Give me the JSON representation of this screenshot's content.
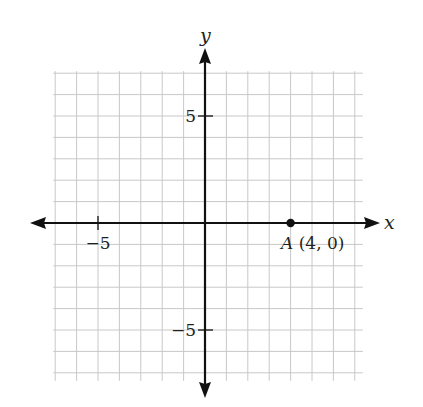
{
  "chart_data": {
    "type": "scatter",
    "title": "",
    "xlabel": "x",
    "ylabel": "y",
    "xlim": [
      -7,
      7
    ],
    "ylim": [
      -7,
      7
    ],
    "grid": true,
    "grid_step": 1,
    "x_ticks": [
      {
        "value": -5,
        "label": "−5"
      }
    ],
    "y_ticks": [
      {
        "value": 5,
        "label": "5"
      },
      {
        "value": -5,
        "label": "−5"
      }
    ],
    "points": [
      {
        "name": "A",
        "x": 4,
        "y": 0,
        "label": "A (4, 0)"
      }
    ],
    "colors": {
      "axis": "#111111",
      "grid": "#c8c8c8",
      "point": "#111111"
    }
  },
  "labels": {
    "x_axis": "x",
    "y_axis": "y",
    "x_tick_neg5": "−5",
    "y_tick_5": "5",
    "y_tick_neg5": "−5",
    "point_A_name": "A",
    "point_A_coords": " (4, 0)"
  }
}
